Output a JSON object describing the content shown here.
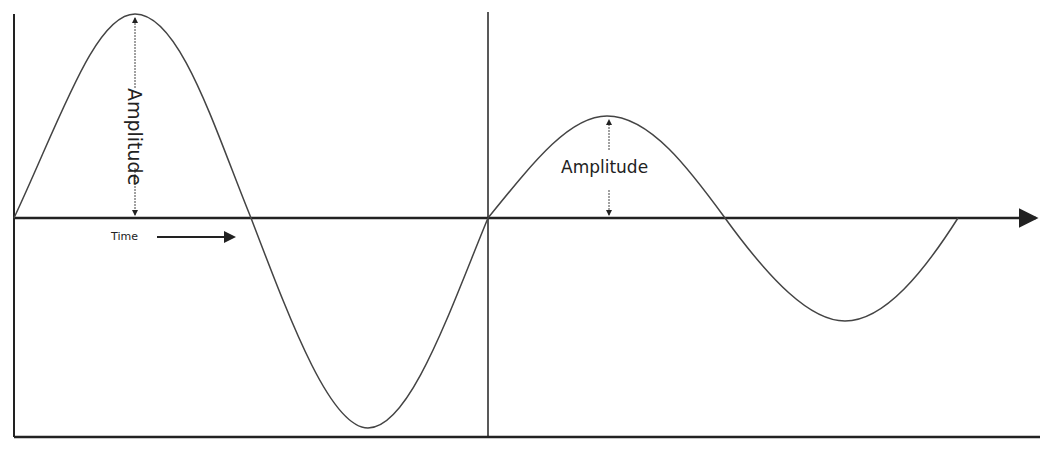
{
  "diagram": {
    "title": "",
    "labels": {
      "amplitude_large": "Amplitude",
      "amplitude_small": "Amplitude",
      "time": "Time"
    },
    "colors": {
      "line": "#333333",
      "axis": "#222222",
      "background": "#ffffff"
    },
    "waves": [
      {
        "name": "large-amplitude-wave",
        "x_start": 14,
        "x_end": 488,
        "peak_y": 14,
        "trough_y": 428,
        "baseline_y": 218
      },
      {
        "name": "small-amplitude-wave",
        "x_start": 488,
        "x_end": 958,
        "peak_y": 116,
        "trough_y": 321,
        "baseline_y": 218
      }
    ]
  }
}
